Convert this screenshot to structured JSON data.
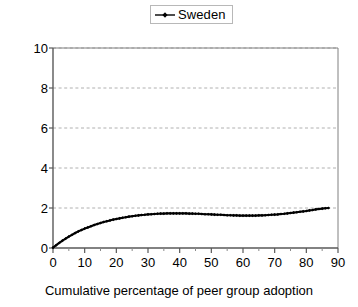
{
  "chart_data": {
    "type": "line",
    "title": "",
    "xlabel": "Cumulative percentage of peer group adoption",
    "ylabel": "Predicted effect",
    "xlim": [
      0,
      90
    ],
    "ylim": [
      0,
      10
    ],
    "xticks": [
      0,
      10,
      20,
      30,
      40,
      50,
      60,
      70,
      80,
      90
    ],
    "yticks": [
      0,
      2,
      4,
      6,
      8,
      10
    ],
    "grid": "horizontal-dashed",
    "legend": {
      "position": "top-center",
      "entries": [
        {
          "name": "Sweden",
          "marker": "small-diamond",
          "line": "solid",
          "color": "#000000"
        }
      ]
    },
    "series": [
      {
        "name": "Sweden",
        "marker": "small-diamond",
        "color": "#000000",
        "x": [
          0,
          1,
          2,
          3,
          4,
          5,
          6,
          7,
          8,
          9,
          10,
          11,
          12,
          13,
          14,
          15,
          16,
          17,
          18,
          19,
          20,
          21,
          22,
          23,
          24,
          25,
          26,
          27,
          28,
          29,
          30,
          31,
          32,
          33,
          34,
          35,
          36,
          37,
          38,
          39,
          40,
          41,
          42,
          43,
          44,
          45,
          46,
          47,
          48,
          49,
          50,
          51,
          52,
          53,
          54,
          55,
          56,
          57,
          58,
          59,
          60,
          61,
          62,
          63,
          64,
          65,
          66,
          67,
          68,
          69,
          70,
          71,
          72,
          73,
          74,
          75,
          76,
          77,
          78,
          79,
          80,
          81,
          82,
          83,
          84,
          85,
          86,
          87
        ],
        "y": [
          0.02,
          0.14,
          0.26,
          0.37,
          0.47,
          0.57,
          0.66,
          0.75,
          0.83,
          0.9,
          0.97,
          1.03,
          1.09,
          1.15,
          1.2,
          1.25,
          1.3,
          1.34,
          1.38,
          1.42,
          1.45,
          1.48,
          1.51,
          1.54,
          1.57,
          1.59,
          1.61,
          1.63,
          1.65,
          1.66,
          1.68,
          1.69,
          1.7,
          1.71,
          1.72,
          1.72,
          1.73,
          1.73,
          1.73,
          1.73,
          1.73,
          1.73,
          1.73,
          1.72,
          1.72,
          1.71,
          1.71,
          1.7,
          1.69,
          1.69,
          1.68,
          1.67,
          1.66,
          1.66,
          1.65,
          1.64,
          1.64,
          1.63,
          1.63,
          1.62,
          1.62,
          1.62,
          1.62,
          1.62,
          1.62,
          1.63,
          1.63,
          1.64,
          1.65,
          1.66,
          1.67,
          1.68,
          1.7,
          1.71,
          1.73,
          1.75,
          1.77,
          1.79,
          1.81,
          1.83,
          1.85,
          1.88,
          1.9,
          1.93,
          1.95,
          1.97,
          1.99,
          2.0
        ]
      }
    ]
  },
  "axes": {
    "y_title": "Predicted effect",
    "x_title": "Cumulative percentage of peer group adoption",
    "y_tick_labels": [
      "10",
      "8",
      "6",
      "4",
      "2",
      "0"
    ],
    "x_tick_labels": [
      "0",
      "10",
      "20",
      "30",
      "40",
      "50",
      "60",
      "70",
      "80",
      "90"
    ]
  },
  "legend": {
    "series_label": "Sweden"
  },
  "colors": {
    "series": "#000000",
    "grid": "#b0b0b0",
    "frame": "#808080",
    "background": "#ffffff"
  }
}
